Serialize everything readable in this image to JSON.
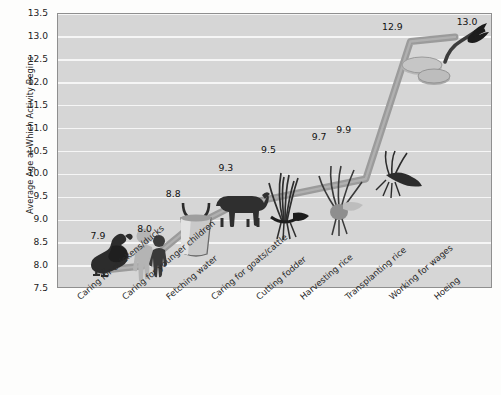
{
  "chart_data": {
    "type": "line",
    "title": "",
    "subtitle": "",
    "xlabel": "",
    "ylabel": "Average Age at Which Activity Begins",
    "ylim": [
      7.5,
      13.5
    ],
    "ytick_step": 0.5,
    "grid": true,
    "legend": "none",
    "categories": [
      "Caring for chickens/ducks",
      "Caring for younger children",
      "Fetching water",
      "Caring for goats/cattle",
      "Cutting fodder",
      "Harvesting rice",
      "Transplanting rice",
      "Working for wages",
      "Hoeing"
    ],
    "values": [
      7.9,
      8.0,
      8.8,
      9.3,
      9.5,
      9.7,
      9.9,
      12.9,
      13.0
    ],
    "data_labels": [
      "7.9",
      "8.0",
      "8.8",
      "9.3",
      "9.5",
      "9.7",
      "9.9",
      "12.9",
      "13.0"
    ],
    "ytick_labels": [
      "13.5",
      "13.0",
      "12.5",
      "12.0",
      "11.5",
      "11.0",
      "10.5",
      "10.0",
      "9.5",
      "9.0",
      "8.5",
      "8.0",
      "7.5"
    ],
    "ytick_values": [
      13.5,
      13.0,
      12.5,
      12.0,
      11.5,
      11.0,
      10.5,
      10.0,
      9.5,
      9.0,
      8.5,
      8.0,
      7.5
    ],
    "point_icons": [
      "chicken-icon",
      "children-icon",
      "water-bucket-icon",
      "cattle-icon",
      "fodder-grass-icon",
      "rice-harvest-icon",
      "rice-transplant-icon",
      "coins-wages-icon",
      "hoe-icon"
    ]
  },
  "colors": {
    "page_background": "#fdfdfc",
    "plot_background": "#d6d6d6",
    "gridline": "#f6f6f6",
    "plot_border": "#8f8f8f",
    "series_line": "#9b9b9b",
    "series_line_dark": "#7e7e7e",
    "text": "#1b1b1b",
    "art_dark": "#2c2c2c",
    "art_mid": "#8e8e8e",
    "art_light": "#b4b4b4"
  }
}
